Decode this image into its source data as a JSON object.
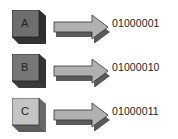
{
  "diagram": {
    "rows": [
      {
        "letter": "A",
        "code": "01000001",
        "face_color": "#6e6e6e",
        "side_color": "#3e3e3e",
        "top_color": "#8a8a8a"
      },
      {
        "letter": "B",
        "code": "01000010",
        "face_color": "#777777",
        "side_color": "#444444",
        "top_color": "#929292"
      },
      {
        "letter": "C",
        "code": "01000011",
        "face_color": "#c4c4c4",
        "side_color": "#7a7a7a",
        "top_color": "#d8d8d8"
      }
    ],
    "arrow_colors": {
      "body": "#b0b0b0",
      "shadow": "#5a5a5a",
      "outline": "#333333"
    }
  }
}
